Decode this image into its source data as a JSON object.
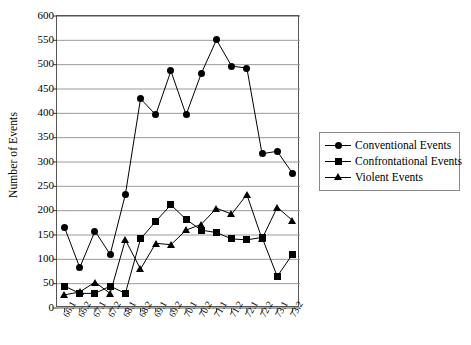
{
  "chart_data": {
    "type": "line",
    "title": "",
    "xlabel": "",
    "ylabel": "Number of Events",
    "ylim": [
      0,
      600
    ],
    "ytick_step": 50,
    "grid": true,
    "legend_position": "right",
    "categories": [
      "66.1",
      "66.2",
      "67.1",
      "67.2",
      "68.1",
      "68.2",
      "69.1",
      "69.2",
      "70.1",
      "70.2",
      "71.1",
      "71.2",
      "72.1",
      "72.2",
      "73.1",
      "73.2"
    ],
    "ytick_labels": [
      "0",
      "50",
      "100",
      "150",
      "200",
      "250",
      "300",
      "350",
      "400",
      "450",
      "500",
      "550",
      "600"
    ],
    "series": [
      {
        "name": "Conventional Events",
        "marker": "circle",
        "color": "#000000",
        "values": [
          165,
          83,
          158,
          110,
          233,
          430,
          397,
          487,
          397,
          482,
          551,
          497,
          493,
          317,
          322,
          277
        ]
      },
      {
        "name": "Confrontational Events",
        "marker": "square",
        "color": "#000000",
        "values": [
          45,
          30,
          30,
          45,
          30,
          142,
          178,
          212,
          182,
          160,
          155,
          142,
          140,
          145,
          65,
          110
        ]
      },
      {
        "name": "Violent Events",
        "marker": "triangle",
        "color": "#000000",
        "values": [
          27,
          33,
          53,
          30,
          140,
          80,
          133,
          130,
          160,
          172,
          205,
          193,
          233,
          142,
          207,
          180
        ]
      }
    ]
  },
  "legend": {
    "items": [
      {
        "label": "Conventional Events",
        "marker": "circle"
      },
      {
        "label": "Confrontational Events",
        "marker": "square"
      },
      {
        "label": "Violent Events",
        "marker": "triangle"
      }
    ]
  }
}
